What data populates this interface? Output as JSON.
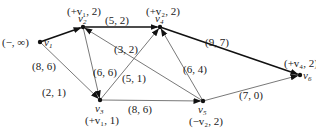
{
  "nodes": [
    {
      "id": "v1",
      "label": "v",
      "sub": "1",
      "mark": "(−, ∞)",
      "x": 40,
      "y": 42
    },
    {
      "id": "v2",
      "label": "v",
      "sub": "2",
      "mark": "(+v₁, 2)",
      "x": 83,
      "y": 27
    },
    {
      "id": "v3",
      "label": "v",
      "sub": "3",
      "mark": "(+v₁, 1)",
      "x": 100,
      "y": 100
    },
    {
      "id": "v4",
      "label": "v",
      "sub": "4",
      "mark": "(+v₂, 2)",
      "x": 160,
      "y": 27
    },
    {
      "id": "v5",
      "label": "v",
      "sub": "5",
      "mark": "(−v₂, 2)",
      "x": 203,
      "y": 101
    },
    {
      "id": "v6",
      "label": "v",
      "sub": "6",
      "mark": "(+v₄, 2)",
      "x": 300,
      "y": 75
    }
  ],
  "edges": [
    {
      "from": "v1",
      "to": "v2",
      "label": "(8, 6)",
      "bold": true
    },
    {
      "from": "v1",
      "to": "v3",
      "label": "(2, 1)",
      "bold": false
    },
    {
      "from": "v2",
      "to": "v4",
      "label": "(5, 2)",
      "bold": true
    },
    {
      "from": "v2",
      "to": "v3",
      "label": "(6, 6)",
      "bold": false
    },
    {
      "from": "v3",
      "to": "v4",
      "label": "(5, 1)",
      "bold": false
    },
    {
      "from": "v5",
      "to": "v2",
      "label": "(3, 2)",
      "bold": false
    },
    {
      "from": "v3",
      "to": "v5",
      "label": "(8, 6)",
      "bold": false
    },
    {
      "from": "v5",
      "to": "v4",
      "label": "(6, 4)",
      "bold": false
    },
    {
      "from": "v4",
      "to": "v6",
      "label": "(9, 7)",
      "bold": true
    },
    {
      "from": "v5",
      "to": "v6",
      "label": "(7, 0)",
      "bold": false
    }
  ]
}
